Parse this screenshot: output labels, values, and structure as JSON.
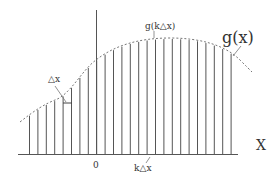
{
  "diagram": {
    "curve_label": "g(x)",
    "sample_label": "g(k△x)",
    "delta_label": "△x",
    "origin_label": "0",
    "k_label": "k△x",
    "x_axis_label": "X"
  },
  "colors": {
    "line": "#555555",
    "curve": "#777777",
    "text": "#333333"
  }
}
